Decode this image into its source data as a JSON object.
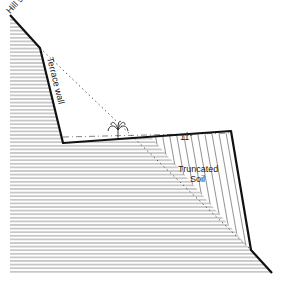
{
  "diagram": {
    "labels": {
      "hill_slope": "Hill slope",
      "terrace_wall": "Terrace wall",
      "angle": "11°",
      "truncated_soil_line1": "Truncated",
      "truncated_soil_line2": "Soil"
    },
    "colors": {
      "outline": "#111111",
      "hatch": "#8a8a8a",
      "dotted": "#555555",
      "background": "#ffffff"
    }
  }
}
